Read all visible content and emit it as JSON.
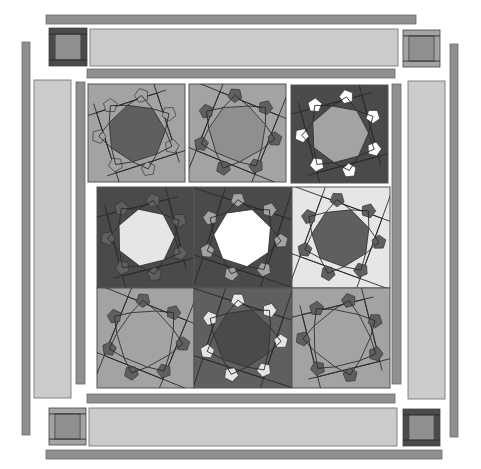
{
  "colors": {
    "light": "#cbcbcb",
    "mid": "#a3a3a3",
    "medium": "#8f8f8f",
    "dark": "#5f5f5f",
    "darker": "#4a4a4a",
    "white": "#ffffff",
    "verylight": "#e6e6e6"
  },
  "borders": {
    "outer_top": {
      "x": 46,
      "y": 15,
      "w": 370,
      "h": 9,
      "fill": "medium"
    },
    "outer_bottom": {
      "x": 46,
      "y": 450,
      "w": 396,
      "h": 9,
      "fill": "medium"
    },
    "outer_left": {
      "x": 22,
      "y": 42,
      "w": 8,
      "h": 393,
      "fill": "medium"
    },
    "outer_right": {
      "x": 450,
      "y": 44,
      "w": 8,
      "h": 393,
      "fill": "medium"
    },
    "wide_top": {
      "x": 90,
      "y": 29,
      "w": 308,
      "h": 37,
      "fill": "light"
    },
    "wide_bottom": {
      "x": 89,
      "y": 408,
      "w": 308,
      "h": 38,
      "fill": "light"
    },
    "wide_left": {
      "x": 34,
      "y": 80,
      "w": 37,
      "h": 318,
      "fill": "light"
    },
    "wide_right": {
      "x": 408,
      "y": 81,
      "w": 37,
      "h": 318,
      "fill": "light"
    },
    "inner_top": {
      "x": 87,
      "y": 69,
      "w": 308,
      "h": 9,
      "fill": "medium"
    },
    "inner_bottom": {
      "x": 87,
      "y": 394,
      "w": 308,
      "h": 9,
      "fill": "medium"
    },
    "inner_left": {
      "x": 76,
      "y": 82,
      "w": 9,
      "h": 302,
      "fill": "medium"
    },
    "inner_right": {
      "x": 392,
      "y": 84,
      "w": 9,
      "h": 300,
      "fill": "medium"
    }
  },
  "corners": [
    {
      "name": "corner-top-left",
      "x": 49,
      "y": 28,
      "size": 38,
      "frame": "darker",
      "center": "medium"
    },
    {
      "name": "corner-top-right",
      "x": 403,
      "y": 30,
      "size": 37,
      "frame": "mid",
      "center": "medium"
    },
    {
      "name": "corner-bottom-left",
      "x": 49,
      "y": 408,
      "size": 37,
      "frame": "mid",
      "center": "medium"
    },
    {
      "name": "corner-bottom-right",
      "x": 403,
      "y": 409,
      "size": 37,
      "frame": "darker",
      "center": "medium"
    }
  ],
  "blocks": [
    {
      "name": "block-r1c1",
      "x": 88,
      "y": 84,
      "w": 97,
      "h": 98,
      "bg": "mid",
      "ring": "mid",
      "center": "dark",
      "points": "mid",
      "rot": -18
    },
    {
      "name": "block-r1c2",
      "x": 189,
      "y": 84,
      "w": 97,
      "h": 98,
      "bg": "mid",
      "ring": "mid",
      "center": "medium",
      "points": "dark",
      "rot": 22
    },
    {
      "name": "block-r1c3",
      "x": 291,
      "y": 85,
      "w": 97,
      "h": 98,
      "bg": "darker",
      "ring": "darker",
      "center": "mid",
      "points": "white",
      "rot": -15
    },
    {
      "name": "block-r2c1",
      "x": 97,
      "y": 187,
      "w": 97,
      "h": 101,
      "bg": "darker",
      "ring": "dark",
      "center": "verylight",
      "points": "dark",
      "rot": -14
    },
    {
      "name": "block-r2c2",
      "x": 194,
      "y": 187,
      "w": 98,
      "h": 101,
      "bg": "darker",
      "ring": "darker",
      "center": "white",
      "points": "mid",
      "rot": 18
    },
    {
      "name": "block-r2c3",
      "x": 292,
      "y": 187,
      "w": 98,
      "h": 101,
      "bg": "verylight",
      "ring": "verylight",
      "center": "dark",
      "points": "dark",
      "rot": 20
    },
    {
      "name": "block-r3c1",
      "x": 97,
      "y": 288,
      "w": 97,
      "h": 100,
      "bg": "mid",
      "ring": "mid",
      "center": "mid",
      "points": "dark",
      "rot": 22
    },
    {
      "name": "block-r3c2",
      "x": 194,
      "y": 288,
      "w": 98,
      "h": 100,
      "bg": "dark",
      "ring": "medium",
      "center": "darker",
      "points": "verylight",
      "rot": 18
    },
    {
      "name": "block-r3c3",
      "x": 292,
      "y": 288,
      "w": 98,
      "h": 100,
      "bg": "mid",
      "ring": "mid",
      "center": "mid",
      "points": "dark",
      "rot": -14
    }
  ]
}
